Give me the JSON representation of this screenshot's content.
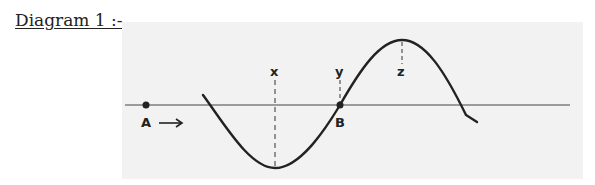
{
  "title": "Diagram 1 :-",
  "diagram": {
    "type": "transverse-wave",
    "points": {
      "A": "A",
      "B": "B"
    },
    "direction_arrow": "→",
    "markers": {
      "x": "x",
      "y": "y",
      "z": "z"
    },
    "colors": {
      "background": "#f2f2f2",
      "line": "#222222"
    }
  }
}
